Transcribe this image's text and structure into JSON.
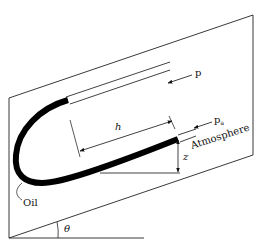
{
  "diagram": {
    "type": "inclined-manometer",
    "labels": {
      "pressure": "p",
      "atm_pressure": "p",
      "atm_subscript": "a",
      "atmosphere": "Atmosphere",
      "length": "h",
      "height": "z",
      "fluid": "Oil",
      "angle": "θ"
    },
    "colors": {
      "line": "#111111",
      "fluid": "#000000",
      "background": "#ffffff"
    }
  }
}
